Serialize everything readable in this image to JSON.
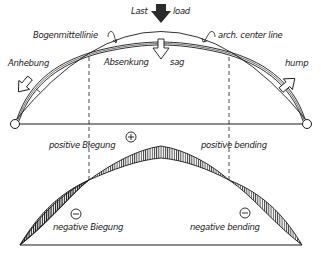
{
  "diagram": {
    "type": "structural-arch-deformation",
    "colors": {
      "ink": "#1a1a1a",
      "background": "#ffffff",
      "load_arrow": "#2a2a2a"
    },
    "top_panel": {
      "load_label_de": "Last",
      "load_label_en": "load",
      "centerline_label_de": "Bogenmittellinie",
      "centerline_label_en": "arch. center line",
      "rise_label_de": "Anhebung",
      "rise_label_en": "hump",
      "sag_label_de": "Absenkung",
      "sag_label_en": "sag"
    },
    "bottom_panel": {
      "positive_label_de": "positive Biegung",
      "positive_label_en": "positive bending",
      "negative_label_de": "negative Biegung",
      "negative_label_en": "negative bending",
      "plus_sign": "+",
      "minus_sign": "−"
    }
  }
}
